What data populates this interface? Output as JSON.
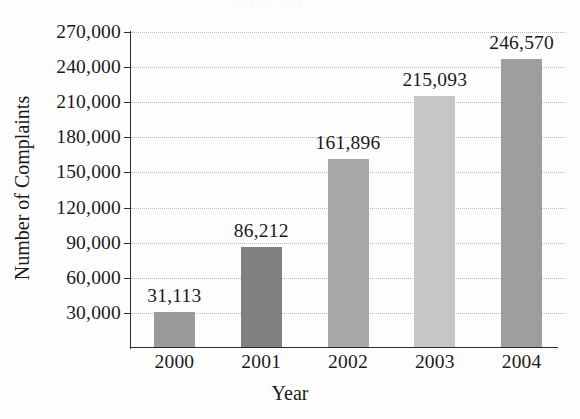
{
  "figure": {
    "cropped_title_remnant": "· · · · · · · ·",
    "background_color": "#fdfdfd",
    "axis_color": "#2b2b2b",
    "gridline_color": "#b9b9b9",
    "text_color": "#1a1a1a"
  },
  "chart_data": {
    "type": "bar",
    "title": "",
    "xlabel": "Year",
    "ylabel": "Number of Complaints",
    "categories": [
      "2000",
      "2001",
      "2002",
      "2003",
      "2004"
    ],
    "values": [
      31113,
      86212,
      161896,
      215093,
      246570
    ],
    "value_labels": [
      "31,113",
      "86,212",
      "161,896",
      "215,093",
      "246,570"
    ],
    "bar_colors": [
      "#9a9a9a",
      "#808080",
      "#a8a8a8",
      "#c6c6c6",
      "#9e9e9e"
    ],
    "ylim": [
      0,
      270000
    ],
    "ytick_values": [
      30000,
      60000,
      90000,
      120000,
      150000,
      180000,
      210000,
      240000,
      270000
    ],
    "ytick_labels": [
      "30,000",
      "60,000",
      "90,000",
      "120,000",
      "150,000",
      "180,000",
      "210,000",
      "240,000",
      "270,000"
    ],
    "grid": "horizontal-dotted",
    "legend": "none"
  }
}
